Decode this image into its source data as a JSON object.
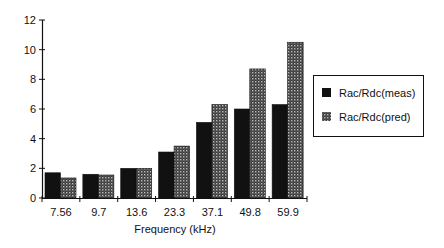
{
  "chart_data": {
    "type": "bar",
    "title": "",
    "xlabel": "Frequency (kHz)",
    "ylabel": "",
    "categories": [
      "7.56",
      "9.7",
      "13.6",
      "23.3",
      "37.1",
      "49.8",
      "59.9"
    ],
    "series": [
      {
        "name": "Rac/Rdc(meas)",
        "values": [
          1.7,
          1.6,
          2.0,
          3.1,
          5.1,
          6.0,
          6.3
        ],
        "color": "#111111",
        "pattern": "solid"
      },
      {
        "name": "Rac/Rdc(pred)",
        "values": [
          1.35,
          1.55,
          2.0,
          3.5,
          6.3,
          8.7,
          10.5
        ],
        "color": "#444444",
        "pattern": "dotted"
      }
    ],
    "ylim": [
      0,
      12
    ],
    "yticks": [
      0,
      2,
      4,
      6,
      8,
      10,
      12
    ],
    "grid": false,
    "legend_position": "right"
  }
}
